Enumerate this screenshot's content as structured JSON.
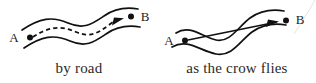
{
  "figure": {
    "name": "distance-comparison-diagram",
    "background_color": "#ffffff",
    "ink_color": "#111111",
    "panels": [
      {
        "id": "by-road",
        "caption": "by road",
        "route_style": "dashed",
        "route_description": "dashed path curving along the winding road from A to B",
        "nodes": [
          {
            "id": "A",
            "label": "A",
            "x": 30,
            "y": 37
          },
          {
            "id": "B",
            "label": "B",
            "x": 131,
            "y": 21
          }
        ],
        "arrow": {
          "present": true,
          "direction": "A-to-B",
          "head_x": 122,
          "head_y": 23
        }
      },
      {
        "id": "crow-flies",
        "caption": "as the crow flies",
        "route_style": "straight",
        "route_description": "straight arrow from A to B crossing over the winding road",
        "nodes": [
          {
            "id": "A",
            "label": "A",
            "x": 27,
            "y": 40
          },
          {
            "id": "B",
            "label": "B",
            "x": 128,
            "y": 22
          }
        ],
        "arrow": {
          "present": true,
          "direction": "A-to-B",
          "head_x": 119,
          "head_y": 23
        }
      }
    ]
  }
}
